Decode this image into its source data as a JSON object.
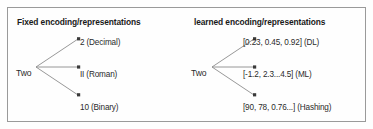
{
  "figure": {
    "type": "tree-diagram",
    "border_color": "#9a9a9a",
    "background_color": "#fefefe",
    "arrow_color": "#8c8c8c",
    "text_color": "#2b2b2b",
    "panels": [
      {
        "id": "fixed",
        "title": "Fixed encoding/representations",
        "root": "Two",
        "leaves": [
          "2 (Decimal)",
          "II (Roman)",
          "10 (Binary)"
        ]
      },
      {
        "id": "learned",
        "title": "learned encoding/representations",
        "root": "Two",
        "leaves": [
          "[0.23, 0.45, 0.92] (DL)",
          "[-1.2, 2.3...4.5] (ML)",
          "[90, 78, 0.76...] (Hashing)"
        ]
      }
    ]
  }
}
